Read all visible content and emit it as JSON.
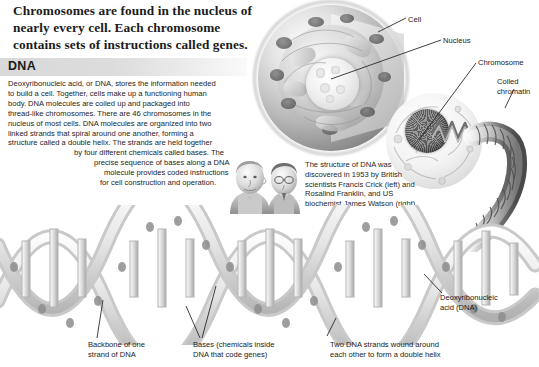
{
  "headline": "Chromosomes are found in the nucleus of nearly every cell. Each chromosome contains sets of instructions called genes.",
  "dna_section": {
    "heading": "DNA",
    "paragraph_lines": [
      "Deoxyribonucleic acid, or DNA, stores the information needed",
      "to build a cell. Together, cells make up a functioning human",
      "body. DNA molecules are coiled up and packaged into",
      "thread-like chromosomes. There are 46 chromosomes in the",
      "nucleus of most cells. DNA molecules are organized into two",
      "linked strands that spiral around one another, forming a",
      "structure called a double helix. The strands are held together",
      "by four different chemicals called bases. The",
      "precise sequence of bases along a DNA",
      "molecule provides coded instructions",
      "for cell construction and operation."
    ]
  },
  "scientists_caption": "The structure of DNA was discovered in 1953 by British scientists Francis Crick (left) and Rosalind Franklin, and US biochemist James Watson (right).",
  "callouts": {
    "cell": "Cell",
    "nucleus": "Nucleus",
    "chromosome": "Chromosome",
    "coiled_chromatin": "Coiled\nchromatin",
    "deoxyribonucleic_acid": "Deoxyribonucleic\nacid (DNA)",
    "backbone": "Backbone of one\nstrand of DNA",
    "bases": "Bases (chemicals inside\nDNA that code genes)",
    "two_strands": "Two DNA strands wound around\neach other to form a double helix"
  },
  "colors": {
    "text": "#1a1a1a",
    "band": "#d9d9d9",
    "background": "#ffffff",
    "illustration_dark": "#3c3c3c",
    "illustration_light": "#f3f3f3"
  },
  "illustrations": {
    "cell_diagram": "cutaway-animal-cell",
    "nucleus_blowup": "nucleus-with-chromosome",
    "coiled_chromatin": "coiled-chromatin-spiral",
    "double_helix": "dna-double-helix-ladder",
    "portrait": "crick-and-watson-portrait"
  }
}
